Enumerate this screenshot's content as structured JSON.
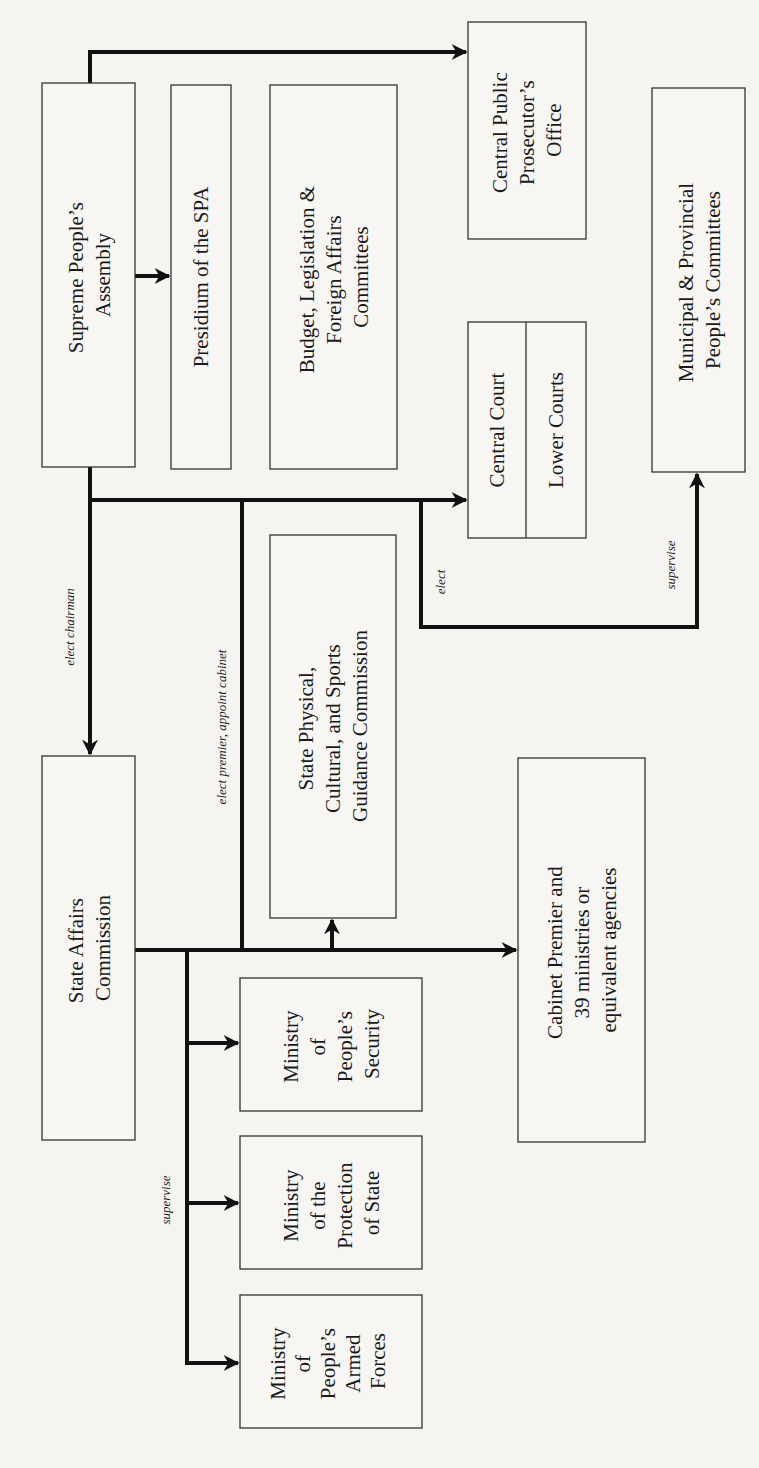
{
  "diagram": {
    "orientation": "rotated 90 degrees counter-clockwise",
    "nodes": {
      "spa": {
        "lines": [
          "Supreme People’s",
          "Assembly"
        ]
      },
      "presidium": {
        "lines": [
          "Presidium of the SPA"
        ]
      },
      "committees": {
        "lines": [
          "Budget, Legislation &",
          "Foreign Affairs",
          "Committees"
        ]
      },
      "prosecutor": {
        "lines": [
          "Central Public",
          "Prosecutor’s",
          "Office"
        ]
      },
      "central_court": {
        "lines": [
          "Central Court"
        ]
      },
      "lower_courts": {
        "lines": [
          "Lower Courts"
        ]
      },
      "municipal": {
        "lines": [
          "Municipal & Provincial",
          "People’s Committees"
        ]
      },
      "sac": {
        "lines": [
          "State Affairs",
          "Commission"
        ]
      },
      "sports": {
        "lines": [
          "State Physical,",
          "Cultural, and Sports",
          "Guidance Commission"
        ]
      },
      "cabinet": {
        "lines": [
          "Cabinet Premier and",
          "39 ministries or",
          "equivalent agencies"
        ]
      },
      "security": {
        "lines": [
          "Ministry",
          "of",
          "People’s",
          "Security"
        ]
      },
      "protection": {
        "lines": [
          "Ministry",
          "of the",
          "Protection",
          "of State"
        ]
      },
      "armed_forces": {
        "lines": [
          "Ministry",
          "of",
          "People’s",
          "Armed",
          "Forces"
        ]
      }
    },
    "edge_labels": {
      "elect_chairman": "elect chairman",
      "elect_premier": "elect premier, appoint cabinet",
      "elect": "elect",
      "supervise_local": "supervise",
      "supervise_ministries": "supervise"
    }
  }
}
